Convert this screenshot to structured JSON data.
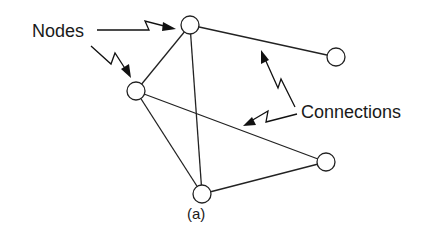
{
  "diagram": {
    "type": "network-graph",
    "caption": "(a)",
    "labels": {
      "nodes": "Nodes",
      "connections": "Connections"
    },
    "colors": {
      "background": "#ffffff",
      "stroke": "#222222",
      "text": "#1a1a1a"
    },
    "nodes": [
      {
        "id": "n1",
        "x": 190,
        "y": 25,
        "r": 9
      },
      {
        "id": "n2",
        "x": 136,
        "y": 91,
        "r": 9
      },
      {
        "id": "n3",
        "x": 336,
        "y": 57,
        "r": 9
      },
      {
        "id": "n4",
        "x": 326,
        "y": 162,
        "r": 9
      },
      {
        "id": "n5",
        "x": 202,
        "y": 194,
        "r": 9
      }
    ],
    "edges": [
      {
        "from": "n1",
        "to": "n2"
      },
      {
        "from": "n1",
        "to": "n3"
      },
      {
        "from": "n1",
        "to": "n5"
      },
      {
        "from": "n2",
        "to": "n4"
      },
      {
        "from": "n2",
        "to": "n5"
      },
      {
        "from": "n5",
        "to": "n4"
      }
    ],
    "annotation_arrows": [
      {
        "label": "Nodes",
        "target": "n1",
        "style": "zigzag"
      },
      {
        "label": "Nodes",
        "target": "n2",
        "style": "zigzag"
      },
      {
        "label": "Connections",
        "target": "edge n1-n3",
        "style": "zigzag"
      },
      {
        "label": "Connections",
        "target": "edge n2-n4",
        "style": "zigzag"
      }
    ]
  }
}
